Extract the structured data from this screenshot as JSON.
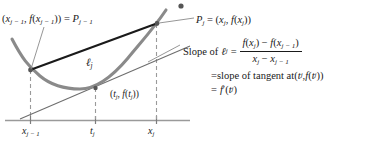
{
  "figure": {
    "type": "mean-value-theorem-secant-tangent-diagram",
    "curve_color": "#8a8a8a",
    "secant_color": "#1a1a1a",
    "tangent_color": "#6e6e6e",
    "axis_color": "#9a9a9a",
    "dash_color": "#9a9a9a",
    "text_color": "#1a1a1a"
  },
  "labels": {
    "left_point": {
      "open": "(",
      "x_var": "x",
      "x_sub": "j − 1",
      "comma": ", ",
      "f_var": "f",
      "f_open": "(",
      "f_x_var": "x",
      "f_x_sub": "j − 1",
      "f_close": ")",
      "close": ")",
      "equals": " = ",
      "P_var": "P",
      "P_sub": "j − 1",
      "full_text": "(x_{j-1}, f(x_{j-1})) = P_{j-1}"
    },
    "right_point": {
      "P_var": "P",
      "P_sub": "j",
      "equals": " = ",
      "open": "(",
      "x_var": "x",
      "x_sub": "j",
      "comma": ", ",
      "f_var": "f",
      "f_open": "(",
      "f_x_var": "x",
      "f_x_sub": "j",
      "f_close": ")",
      "close": ")",
      "full_text": "P_j = (x_j, f(x_j))"
    },
    "secant_line_label": {
      "symbol": "ℓ",
      "sub": "j",
      "full_text": "ℓ_j"
    },
    "tangent_point": {
      "open": "(",
      "t_var": "t",
      "t_sub": "j",
      "comma": ", ",
      "f_var": "f",
      "f_open": "(",
      "f_t_var": "t",
      "f_t_sub": "j",
      "f_close": ")",
      "close": ")",
      "full_text": "(t_j, f(t_j))"
    }
  },
  "ticks": [
    {
      "name": "x-j-minus-1",
      "var": "x",
      "sub": "j − 1",
      "full_text": "x_{j-1}",
      "x_px": 30
    },
    {
      "name": "t-j",
      "var": "t",
      "sub": "j",
      "full_text": "t_j",
      "x_px": 95
    },
    {
      "name": "x-j",
      "var": "x",
      "sub": "j",
      "full_text": "x_j",
      "x_px": 156
    }
  ],
  "equation": {
    "row1": {
      "lead_text": "Slope of ",
      "ell_symbol": "ℓ",
      "ell_sub": "j",
      "equals": "=",
      "numerator": {
        "f1_var": "f",
        "f1_open": "(",
        "f1_x": "x",
        "f1_sub": "j",
        "f1_close": ")",
        "minus": " − ",
        "f2_var": "f",
        "f2_open": "(",
        "f2_x": "x",
        "f2_sub": "j − 1",
        "f2_close": ")",
        "full_text": "f(x_j) − f(x_{j-1})"
      },
      "denominator": {
        "x1_var": "x",
        "x1_sub": "j",
        "minus": " − ",
        "x2_var": "x",
        "x2_sub": "j − 1",
        "full_text": "x_j − x_{j-1}"
      }
    },
    "row2": {
      "equals": "=",
      "text": " slope of tangent at ",
      "point_open": "(",
      "t_var": "t",
      "t_sub": "j",
      "comma": ", ",
      "f_var": "f",
      "f_open": "(",
      "f_t_var": "t",
      "f_t_sub": "j",
      "f_close": ")",
      "point_close": ")",
      "full_text": "= slope of tangent at (t_j, f(t_j))"
    },
    "row3": {
      "equals": "=",
      "f_var": "f",
      "prime": "′",
      "open": "(",
      "t_var": "t",
      "t_sub": "j",
      "close": ")",
      "full_text": "= f′(t_j)"
    }
  }
}
